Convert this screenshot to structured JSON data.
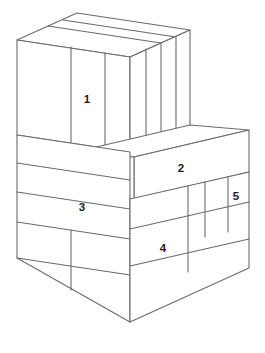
{
  "figure": {
    "background_color": "#ffffff",
    "stroke_color": "#6b6b6b",
    "face_color": "#ffffff",
    "label_color": "#1a1a1a"
  },
  "labels": [
    {
      "id": "1",
      "text": "1",
      "x": 87,
      "y": 100,
      "face": "upper-block-front-left"
    },
    {
      "id": "2",
      "text": "2",
      "x": 181,
      "y": 169,
      "face": "step-front-long"
    },
    {
      "id": "3",
      "text": "3",
      "x": 82,
      "y": 208,
      "face": "base-left-upper-course"
    },
    {
      "id": "4",
      "text": "4",
      "x": 163,
      "y": 249,
      "face": "base-front-lower-course"
    },
    {
      "id": "5",
      "text": "5",
      "x": 236,
      "y": 197,
      "face": "base-right-narrow"
    }
  ]
}
